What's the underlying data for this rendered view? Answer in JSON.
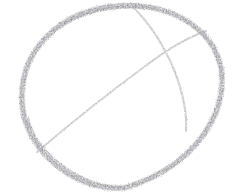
{
  "artwork": {
    "title": "Pencil sketch of a sphere",
    "subject": "sphere",
    "medium": "graphite pencil on paper",
    "background_color": "#ffffff",
    "canvas": {
      "width": 233,
      "height": 194
    }
  },
  "strokes": {
    "outer_ellipse": {
      "name": "sphere-outline",
      "color": "#8d8d91",
      "color_dark": "#74747a",
      "width": 5.2,
      "center_x": 122,
      "center_y": 97,
      "radius_x": 100,
      "radius_y": 91,
      "rotation_deg": -8,
      "path": "M 22,96 C 22,50 60,10 118,6 C 176,2 221,34 222,78 C 223,124 186,170 124,188 C 70,190 32,150 24,116 C 22,108 22,102 22,96 Z"
    },
    "meridian_arc": {
      "name": "sphere-meridian-arc",
      "color": "#b4b4b8",
      "width": 1.9,
      "path": "M 133,7 C 152,26 165,47 175,72 C 184,96 187,115 186,131"
    },
    "equator_arc": {
      "name": "sphere-equator-arc",
      "color": "#b4b4b8",
      "width": 1.9,
      "path": "M 37,152 C 72,122 110,92 148,64 C 168,49 189,37 206,31"
    },
    "crossing_point": {
      "x": 168,
      "y": 48
    }
  },
  "texture": {
    "grain_opacity": 0.45,
    "grain_description": "granular graphite tooth"
  }
}
